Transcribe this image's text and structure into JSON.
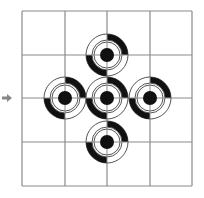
{
  "diagram": {
    "type": "grid-with-targets",
    "grid": {
      "rows": 4,
      "cols": 4,
      "x_lines": [
        22,
        65,
        107,
        150,
        192
      ],
      "y_lines": [
        11,
        55,
        98,
        142,
        186
      ],
      "line_color": "#8a8a8a"
    },
    "arrow": {
      "direction": "right",
      "x": 8,
      "y": 98,
      "color": "#888888"
    },
    "targets": [
      {
        "id": "top",
        "cx": 107,
        "cy": 55
      },
      {
        "id": "left",
        "cx": 65,
        "cy": 98
      },
      {
        "id": "center",
        "cx": 107,
        "cy": 98
      },
      {
        "id": "right",
        "cx": 150,
        "cy": 98
      },
      {
        "id": "bottom",
        "cx": 107,
        "cy": 142
      }
    ],
    "target_style": {
      "outer_radius": 21,
      "band_width": 6,
      "middle_radius": 14,
      "inner_radius": 7,
      "filled_quadrants": [
        "top-right",
        "bottom-left"
      ],
      "fill_color": "#111111",
      "ring_color": "#555555"
    }
  }
}
